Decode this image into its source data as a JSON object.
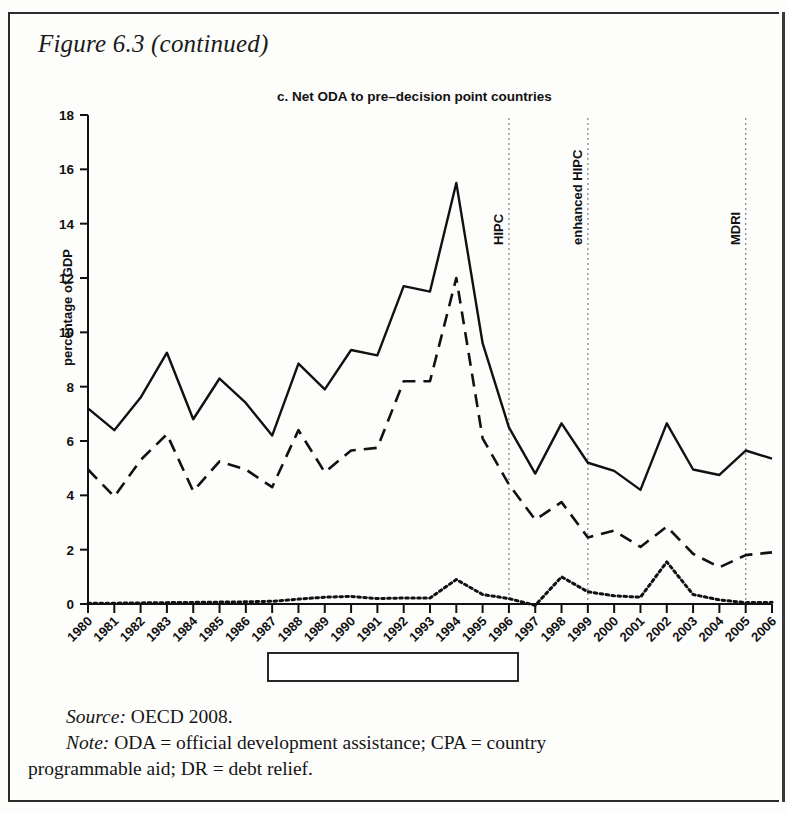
{
  "figure": {
    "label": "Figure 6.3 (continued)",
    "panel_title": "c. Net ODA to pre–decision point countries"
  },
  "footnotes": {
    "source_lead": "Source:",
    "source_text": " OECD 2008.",
    "note_lead": "Note:",
    "note_text": " ODA = official development assistance; CPA = country",
    "note_cont": "programmable aid; DR = debt relief."
  },
  "legend": {
    "items": [
      {
        "label": "net ODA",
        "style": "solid"
      },
      {
        "label": "CPA",
        "style": "dashed"
      },
      {
        "label": "DR",
        "style": "dotted"
      }
    ]
  },
  "chart_data": {
    "type": "line",
    "title": "c. Net ODA to pre–decision point countries",
    "xlabel": "",
    "ylabel": "percentage of GDP",
    "ylim": [
      0,
      18
    ],
    "yticks": [
      0,
      2,
      4,
      6,
      8,
      10,
      12,
      14,
      16,
      18
    ],
    "grid": false,
    "legend_position": "bottom",
    "categories": [
      "1980",
      "1981",
      "1982",
      "1983",
      "1984",
      "1985",
      "1986",
      "1987",
      "1988",
      "1989",
      "1990",
      "1991",
      "1992",
      "1993",
      "1994",
      "1995",
      "1996",
      "1997",
      "1998",
      "1999",
      "2000",
      "2001",
      "2002",
      "2003",
      "2004",
      "2005",
      "2006"
    ],
    "series": [
      {
        "name": "net ODA",
        "style": "solid",
        "values": [
          7.2,
          6.4,
          7.6,
          9.25,
          6.8,
          8.3,
          7.4,
          6.2,
          8.85,
          7.9,
          9.35,
          9.15,
          11.7,
          11.5,
          15.5,
          9.6,
          6.5,
          4.8,
          6.65,
          5.2,
          4.9,
          4.2,
          6.65,
          4.95,
          4.75,
          5.65,
          5.35
        ]
      },
      {
        "name": "CPA",
        "style": "dashed",
        "values": [
          4.95,
          3.95,
          5.3,
          6.25,
          4.15,
          5.25,
          4.95,
          4.3,
          6.4,
          4.85,
          5.65,
          5.75,
          8.2,
          8.2,
          12.0,
          6.1,
          4.4,
          3.1,
          3.75,
          2.45,
          2.7,
          2.1,
          2.85,
          1.85,
          1.35,
          1.8,
          1.9
        ]
      },
      {
        "name": "DR",
        "style": "dotted",
        "values": [
          0.03,
          0.03,
          0.04,
          0.05,
          0.06,
          0.07,
          0.08,
          0.1,
          0.18,
          0.25,
          0.28,
          0.2,
          0.22,
          0.22,
          0.9,
          0.35,
          0.2,
          -0.05,
          1.0,
          0.45,
          0.3,
          0.25,
          1.55,
          0.35,
          0.15,
          0.05,
          0.06
        ]
      }
    ],
    "annotations": [
      {
        "label": "HIPC",
        "x": "1996"
      },
      {
        "label": "enhanced HIPC",
        "x": "1999"
      },
      {
        "label": "MDRI",
        "x": "2005"
      }
    ]
  }
}
